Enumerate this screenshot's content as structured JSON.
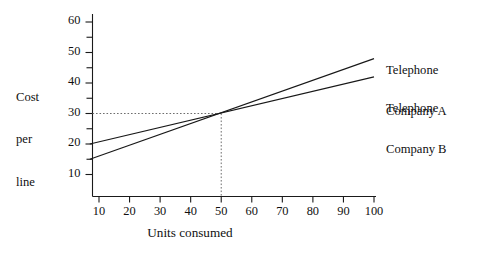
{
  "chart_data": {
    "type": "line",
    "title": "",
    "xlabel": "Units consumed",
    "ylabel": "Cost per line",
    "ylabel_lines": [
      "Cost",
      "per",
      "line"
    ],
    "xlim": [
      0,
      100
    ],
    "ylim": [
      0,
      65
    ],
    "grid": false,
    "legend_position": "right-inline",
    "x_ticks": [
      10,
      20,
      30,
      40,
      50,
      60,
      70,
      80,
      90,
      100
    ],
    "x_tick_labels": [
      "10",
      "20",
      "30",
      "40",
      "50",
      "60",
      "70",
      "80",
      "90",
      "100"
    ],
    "y_ticks": [
      10,
      20,
      30,
      40,
      50,
      60
    ],
    "y_tick_labels": [
      "10",
      "20",
      "30",
      "40",
      "50",
      "60"
    ],
    "y_minor_ticks": [
      15,
      25,
      35,
      45,
      55
    ],
    "series": [
      {
        "name": "Telephone Company A",
        "label_lines": [
          "Telephone",
          "Company A"
        ],
        "x": [
          7,
          100
        ],
        "values": [
          15,
          48
        ]
      },
      {
        "name": "Telephone Company B",
        "label_lines": [
          "Telephone",
          "Company B"
        ],
        "x": [
          7,
          100
        ],
        "values": [
          20,
          42
        ]
      }
    ],
    "annotations": [
      {
        "name": "intersection-guide",
        "x": 50,
        "y": 30,
        "style": "dotted-crosshair",
        "color": "#6e6e6e"
      }
    ]
  }
}
